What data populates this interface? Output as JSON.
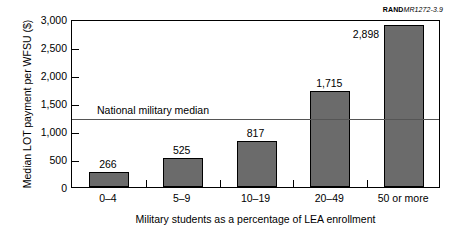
{
  "source_credit": {
    "bold_part": "RAND",
    "italic_part": "MR1272-3.9"
  },
  "chart_data": {
    "type": "bar",
    "title": "",
    "xlabel": "Military students as a percentage of LEA enrollment",
    "ylabel": "Median LOT payment per WFSU ($)",
    "categories": [
      "0–4",
      "5–9",
      "10–19",
      "20–49",
      "50 or more"
    ],
    "values": [
      266,
      525,
      817,
      1715,
      2898
    ],
    "value_labels": [
      "266",
      "525",
      "817",
      "1,715",
      "2,898"
    ],
    "ylim": [
      0,
      3000
    ],
    "yticks": [
      0,
      500,
      1000,
      1500,
      2000,
      2500,
      3000
    ],
    "ytick_labels": [
      "0",
      "500",
      "1,000",
      "1,500",
      "2,000",
      "2,500",
      "3,000"
    ],
    "grid": false,
    "legend": false,
    "bar_color": "#6b6b6b",
    "bar_edge_color": "#000000",
    "reference_line": {
      "label": "National military median",
      "value": 1250,
      "color": "#555555"
    }
  }
}
